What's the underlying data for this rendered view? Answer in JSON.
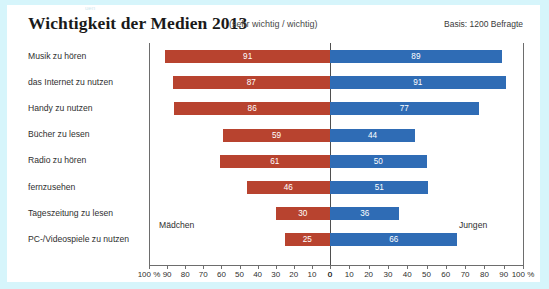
{
  "header": {
    "title": "Wichtigkeit der Medien 2013",
    "subtitle": "(sehr wichtig / wichtig)",
    "basis": "Basis: 1200 Befragte",
    "top_artifact": "uen"
  },
  "annotations": {
    "left_series_note": "Mädchen",
    "right_series_note": "Jungen"
  },
  "axis": {
    "left_tick_labels": [
      "100 %",
      "90",
      "80",
      "70",
      "60",
      "50",
      "40",
      "30",
      "20",
      "10",
      "0"
    ],
    "right_tick_labels": [
      "0",
      "10",
      "20",
      "30",
      "40",
      "50",
      "60",
      "70",
      "80",
      "90",
      "100 %"
    ]
  },
  "chart_data": {
    "type": "bar",
    "title": "Wichtigkeit der Medien 2013",
    "subtitle": "(sehr wichtig / wichtig)",
    "orientation": "horizontal-diverging",
    "xlabel": "",
    "ylabel": "",
    "xlim": [
      0,
      100
    ],
    "grid": false,
    "legend_position": "inline-annotation",
    "categories": [
      "Musik zu hören",
      "das Internet zu nutzen",
      "Handy zu nutzen",
      "Bücher zu lesen",
      "Radio zu hören",
      "fernzusehen",
      "Tageszeitung zu lesen",
      "PC-/Videospiele zu nutzen"
    ],
    "series": [
      {
        "name": "Mädchen",
        "color": "#b8432f",
        "side": "left",
        "values": [
          91,
          87,
          86,
          59,
          61,
          46,
          30,
          25
        ]
      },
      {
        "name": "Jungen",
        "color": "#2f6cb5",
        "side": "right",
        "values": [
          89,
          91,
          77,
          44,
          50,
          51,
          36,
          66
        ]
      }
    ]
  }
}
